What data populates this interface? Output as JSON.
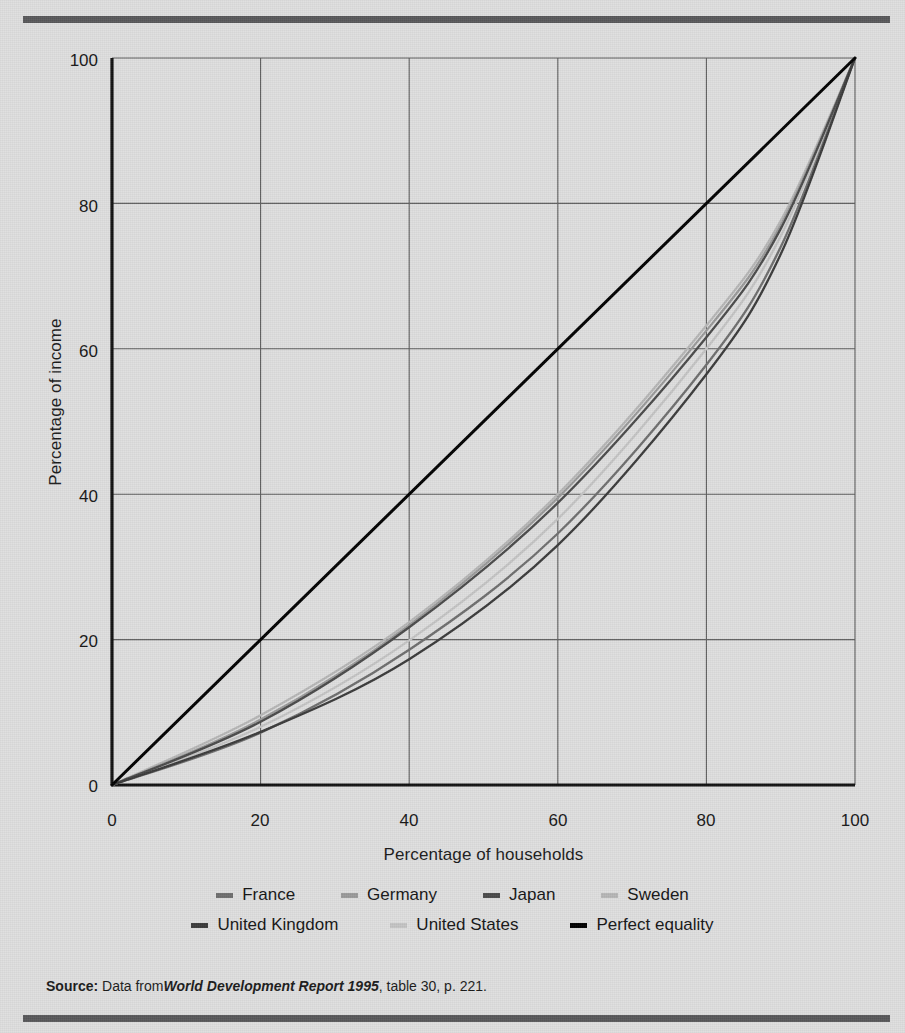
{
  "figure": {
    "background_color": "#dedede",
    "rule_color": "#58585a"
  },
  "source": {
    "label": "Source:",
    "text_before": " Data from",
    "italic_title": "World Development Report 1995",
    "text_after": ", table 30, p. 221."
  },
  "axes": {
    "x_title": "Percentage of households",
    "y_title": "Percentage of income",
    "x_ticks": [
      "0",
      "20",
      "40",
      "60",
      "80",
      "100"
    ],
    "y_ticks": [
      "0",
      "20",
      "40",
      "60",
      "80",
      "100"
    ]
  },
  "legend": {
    "rows": [
      [
        {
          "label": "France",
          "color": "#6e6e6e"
        },
        {
          "label": "Germany",
          "color": "#9a9a9a"
        },
        {
          "label": "Japan",
          "color": "#4a4a4a"
        },
        {
          "label": "Sweden",
          "color": "#b6b6b6"
        }
      ],
      [
        {
          "label": "United Kingdom",
          "color": "#3a3a3a"
        },
        {
          "label": "United States",
          "color": "#c4c4c4"
        },
        {
          "label": "Perfect equality",
          "color": "#000000"
        }
      ]
    ]
  },
  "chart_data": {
    "type": "line",
    "title": "",
    "xlabel": "Percentage of households",
    "ylabel": "Percentage of income",
    "xlim": [
      0,
      100
    ],
    "ylim": [
      0,
      100
    ],
    "xticks": [
      0,
      20,
      40,
      60,
      80,
      100
    ],
    "yticks": [
      0,
      20,
      40,
      60,
      80,
      100
    ],
    "grid": true,
    "legend_position": "below-axis",
    "x": [
      0,
      20,
      40,
      60,
      80,
      90,
      100
    ],
    "series": [
      {
        "name": "France",
        "color": "#6e6e6e",
        "values": [
          0,
          7.2,
          18.6,
          34.6,
          57.8,
          74.0,
          100
        ]
      },
      {
        "name": "Germany",
        "color": "#9a9a9a",
        "values": [
          0,
          9.0,
          22.0,
          39.5,
          62.5,
          77.0,
          100
        ]
      },
      {
        "name": "Japan",
        "color": "#4a4a4a",
        "values": [
          0,
          8.7,
          21.7,
          38.8,
          61.6,
          76.5,
          100
        ]
      },
      {
        "name": "Sweden",
        "color": "#b6b6b6",
        "values": [
          0,
          9.6,
          22.4,
          40.0,
          63.2,
          77.6,
          100
        ]
      },
      {
        "name": "United Kingdom",
        "color": "#3a3a3a",
        "values": [
          0,
          7.3,
          17.3,
          33.0,
          56.5,
          73.0,
          100
        ]
      },
      {
        "name": "United States",
        "color": "#c4c4c4",
        "values": [
          0,
          8.0,
          19.9,
          36.6,
          60.0,
          75.5,
          100
        ]
      },
      {
        "name": "Perfect equality",
        "color": "#000000",
        "values": [
          0,
          20,
          40,
          60,
          80,
          90,
          100
        ]
      }
    ]
  }
}
